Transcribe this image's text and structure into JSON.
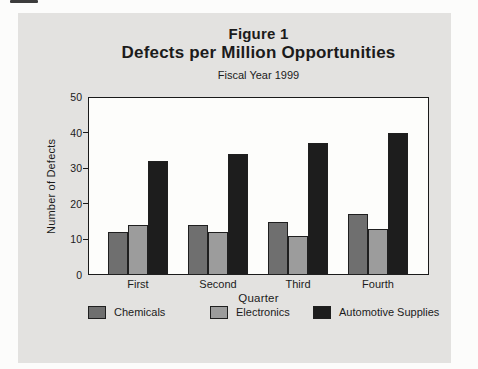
{
  "figure": {
    "title_line1": "Figure 1",
    "title_line2": "Defects per Million Opportunities",
    "subtitle": "Fiscal Year 1999"
  },
  "chart_data": {
    "type": "bar",
    "title": "Figure 1",
    "subtitle": "Defects per Million Opportunities",
    "caption": "Fiscal Year 1999",
    "categories": [
      "First",
      "Second",
      "Third",
      "Fourth"
    ],
    "series": [
      {
        "name": "Chemicals",
        "color": "#6f6f6f",
        "values": [
          12,
          14,
          15,
          17
        ]
      },
      {
        "name": "Electronics",
        "color": "#9c9c9c",
        "values": [
          14,
          12,
          11,
          13
        ]
      },
      {
        "name": "Automotive Supplies",
        "color": "#1d1d1d",
        "values": [
          32,
          34,
          37,
          40
        ]
      }
    ],
    "xlabel": "Quarter",
    "ylabel": "Number of Defects",
    "ylim": [
      0,
      50
    ],
    "yticks": [
      0,
      10,
      20,
      30,
      40,
      50
    ],
    "grid": false,
    "legend_position": "bottom"
  },
  "colors": {
    "panel_background": "#e3e2e0",
    "plot_background": "#fdfdfb",
    "axis": "#1a1a1a",
    "text": "#1b1b1b"
  }
}
